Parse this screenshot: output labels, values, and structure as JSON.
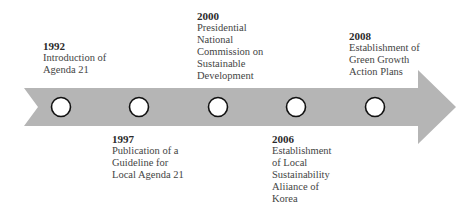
{
  "diagram": {
    "type": "timeline",
    "arrow": {
      "fill": "#b5b5b5",
      "direction": "right"
    },
    "marker_style": {
      "fill": "#ffffff",
      "stroke": "#111111"
    },
    "events": [
      {
        "year": "1992",
        "position": "above",
        "lines": [
          "Introduction of",
          "Agenda 21"
        ]
      },
      {
        "year": "1997",
        "position": "below",
        "lines": [
          "Publication of a",
          "Guideline for",
          "Local Agenda 21"
        ]
      },
      {
        "year": "2000",
        "position": "above",
        "lines": [
          "Presidential",
          "National",
          "Commission on",
          "Sustainable",
          "Development"
        ]
      },
      {
        "year": "2006",
        "position": "below",
        "lines": [
          "Establishment",
          "of Local",
          "Sustainability",
          "Aliiance of",
          "Korea"
        ]
      },
      {
        "year": "2008",
        "position": "above",
        "lines": [
          "Establishment of",
          "Green Growth",
          "Action Plans"
        ]
      }
    ]
  }
}
